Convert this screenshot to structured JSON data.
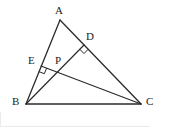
{
  "figure": {
    "kind": "euclidean-geometry-diagram",
    "canvas": {
      "width": 181,
      "height": 127
    },
    "stroke_color": "#2b2b2b",
    "label_color": "#1d1d1d",
    "background_color": "#ffffff",
    "border_color": "#e8e8e8"
  },
  "points": [
    {
      "id": "A",
      "label": "A",
      "x": 60,
      "y": 20,
      "label_x": 55,
      "label_y": 5,
      "name": "point-label-a"
    },
    {
      "id": "B",
      "label": "B",
      "x": 26,
      "y": 104,
      "label_x": 12,
      "label_y": 96,
      "name": "point-label-b"
    },
    {
      "id": "C",
      "label": "C",
      "x": 141,
      "y": 104,
      "label_x": 146,
      "label_y": 96,
      "name": "point-label-c"
    },
    {
      "id": "D",
      "label": "D",
      "x": 84,
      "y": 45,
      "label_x": 86,
      "label_y": 31,
      "name": "point-label-d"
    },
    {
      "id": "E",
      "label": "E",
      "x": 41,
      "y": 66,
      "label_x": 28,
      "label_y": 55,
      "name": "point-label-e"
    },
    {
      "id": "P",
      "label": "P",
      "x": 57,
      "y": 66,
      "label_x": 55,
      "label_y": 55,
      "name": "point-label-p"
    }
  ],
  "segments": [
    {
      "id": "AB",
      "from": "A",
      "to": "B",
      "name": "segment-ab"
    },
    {
      "id": "AC",
      "from": "A",
      "to": "C",
      "name": "segment-ac"
    },
    {
      "id": "BC",
      "from": "B",
      "to": "C",
      "name": "segment-bc"
    },
    {
      "id": "BD",
      "from": "B",
      "to": "D",
      "name": "segment-bd-altitude"
    },
    {
      "id": "CE",
      "from": "C",
      "to": "E",
      "name": "segment-ce-altitude"
    }
  ],
  "right_angle_marks": [
    {
      "id": "at-D",
      "vertex": "D",
      "name": "right-angle-mark-d"
    },
    {
      "id": "at-E",
      "vertex": "E",
      "name": "right-angle-mark-e"
    }
  ]
}
